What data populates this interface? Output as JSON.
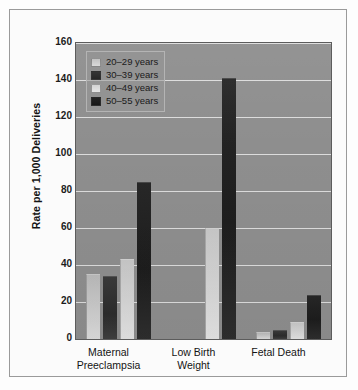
{
  "chart_data": {
    "type": "bar",
    "title": "",
    "xlabel": "",
    "ylabel": "Rate per 1,000 Deliveries",
    "ylim": [
      0,
      160
    ],
    "yticks": [
      0,
      20,
      40,
      60,
      80,
      100,
      120,
      140,
      160
    ],
    "grid": true,
    "legend_position": "top-left",
    "categories": [
      "Maternal Preeclampsia",
      "Low Birth Weight",
      "Fetal Death"
    ],
    "category_lines": [
      [
        "Maternal",
        "Preeclampsia"
      ],
      [
        "Low Birth",
        "Weight"
      ],
      [
        "Fetal Death"
      ]
    ],
    "series": [
      {
        "name": "20–29 years",
        "color": "#cccccc",
        "values": [
          35,
          0,
          4
        ]
      },
      {
        "name": "30–39 years",
        "color": "#2c2c2c",
        "values": [
          34,
          0,
          5
        ]
      },
      {
        "name": "40–49 years",
        "color": "#d6d6d6",
        "values": [
          43,
          60,
          9
        ]
      },
      {
        "name": "50–55 years",
        "color": "#1d1d1d",
        "values": [
          85,
          141,
          24
        ]
      }
    ]
  },
  "legend": {
    "items": [
      {
        "label": "20–29 years"
      },
      {
        "label": "30–39 years"
      },
      {
        "label": "40–49 years"
      },
      {
        "label": "50–55 years"
      }
    ]
  },
  "axis": {
    "y_title": "Rate per 1,000 Deliveries",
    "y_tick_labels": [
      "160",
      "140",
      "120",
      "100",
      "80",
      "60",
      "40",
      "20",
      "0"
    ]
  },
  "colors": {
    "plot_background": "#8e8e8e",
    "gridline": "#dcdcdc",
    "frame_border": "#9a9a9a",
    "page_background": "#fdfdfd",
    "series_20_29": "#cccccc",
    "series_30_39": "#2c2c2c",
    "series_40_49": "#d6d6d6",
    "series_50_55": "#1d1d1d"
  }
}
